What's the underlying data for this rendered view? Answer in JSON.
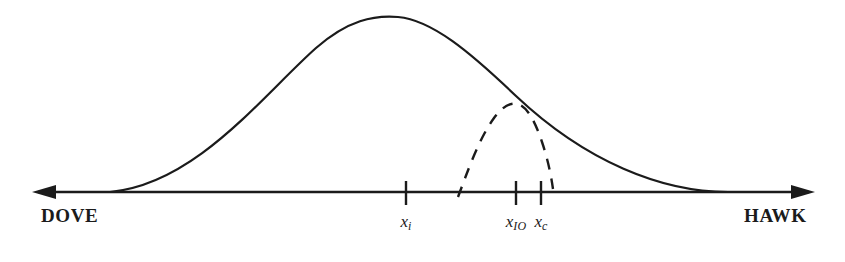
{
  "figure": {
    "kind": "preference-distribution-diagram",
    "background_color": "#ffffff",
    "ink_color": "#1b1b1b"
  },
  "axis": {
    "name": "policy-spectrum-axis",
    "left_label": "DOVE",
    "right_label": "HAWK",
    "line_y": 192,
    "left_tip_x": 32,
    "right_tip_x": 815,
    "stroke_width": 2.6,
    "arrowheads": [
      "left",
      "right"
    ]
  },
  "ticks": [
    {
      "id": "xi",
      "base": "x",
      "subscript": "i",
      "x": 406,
      "top_y": 181,
      "bottom_y": 205,
      "label_y": 212
    },
    {
      "id": "xio",
      "base": "x",
      "subscript": "IO",
      "x": 516,
      "top_y": 181,
      "bottom_y": 205,
      "label_y": 212
    },
    {
      "id": "xc",
      "base": "x",
      "subscript": "c",
      "x": 541,
      "top_y": 181,
      "bottom_y": 205,
      "label_y": 212
    }
  ],
  "curves": [
    {
      "id": "population-distribution",
      "style": "solid",
      "stroke_width": 2.2,
      "left_foot_x": 110,
      "right_foot_x": 728,
      "peak_x": 395,
      "peak_y": 18,
      "baseline_y": 192,
      "description": "large solid bell curve spanning most of the axis"
    },
    {
      "id": "subset-distribution",
      "style": "dashed",
      "stroke_width": 2.4,
      "dash_pattern": "11 9",
      "left_foot_x": 458,
      "right_foot_x": 552,
      "peak_x": 512,
      "peak_y": 103,
      "baseline_y": 186,
      "description": "small dashed bell curve centered near x_IO"
    }
  ]
}
